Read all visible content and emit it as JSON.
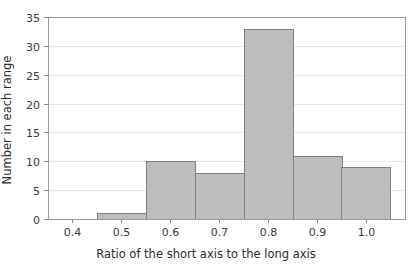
{
  "chart_data": {
    "type": "bar",
    "title": "",
    "xlabel": "Ratio of the short axis to the long axis",
    "ylabel": "Number in each range",
    "categories": [
      "0.4",
      "0.5",
      "0.6",
      "0.7",
      "0.8",
      "0.9",
      "1.0"
    ],
    "values": [
      0,
      1,
      10,
      8,
      33,
      11,
      9
    ],
    "bin_width": 0.1,
    "bin_edges": [
      0.35,
      0.45,
      0.55,
      0.65,
      0.75,
      0.85,
      0.95,
      1.05
    ],
    "xlim": [
      0.35,
      1.08
    ],
    "ylim": [
      0,
      35
    ],
    "xticks": [
      "0.4",
      "0.5",
      "0.6",
      "0.7",
      "0.8",
      "0.9",
      "1.0"
    ],
    "xtick_values": [
      0.4,
      0.5,
      0.6,
      0.7,
      0.8,
      0.9,
      1.0
    ],
    "yticks": [
      "0",
      "5",
      "10",
      "15",
      "20",
      "25",
      "30",
      "35"
    ],
    "ytick_values": [
      0,
      5,
      10,
      15,
      20,
      25,
      30,
      35
    ],
    "grid": "horizontal",
    "legend": "none",
    "colors": {
      "bar_fill": "#bdbdbd",
      "bar_stroke": "#808080",
      "gridline": "#e8e8e8",
      "frame": "#9a9a9a",
      "text": "#2b2b2b",
      "background": "#ffffff"
    }
  }
}
